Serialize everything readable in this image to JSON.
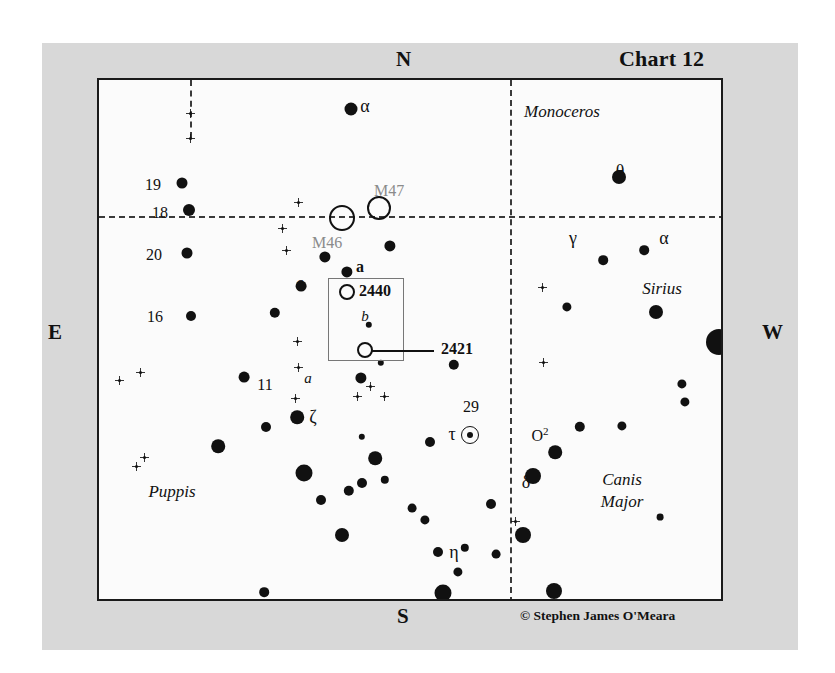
{
  "chart": {
    "title": "Chart 12",
    "credit": "© Stephen James O'Meara",
    "cardinals": {
      "n": "N",
      "s": "S",
      "e": "E",
      "w": "W"
    }
  },
  "constellations": [
    {
      "name": "Monoceros",
      "x": 560,
      "y": 110
    },
    {
      "name": "Puppis",
      "x": 170,
      "y": 490
    },
    {
      "name": "Canis",
      "x": 620,
      "y": 478
    },
    {
      "name": "Major",
      "x": 620,
      "y": 500
    }
  ],
  "deep_sky": [
    {
      "name": "M47",
      "x": 377,
      "y": 206,
      "r": 10,
      "label_dx": -5,
      "label_dy": -26,
      "style": "gray"
    },
    {
      "name": "M46",
      "x": 340,
      "y": 216,
      "r": 11,
      "label_dx": -30,
      "label_dy": 16,
      "style": "gray"
    },
    {
      "name": "2440",
      "x": 345,
      "y": 290,
      "r": 6,
      "label_dx": 12,
      "label_dy": -10,
      "style": "bold"
    },
    {
      "name": "2421",
      "x": 363,
      "y": 348,
      "r": 6,
      "label_dx": 76,
      "label_dy": -10,
      "style": "bold"
    }
  ],
  "labels": [
    {
      "text": "α",
      "x": 363,
      "y": 104,
      "type": "greek"
    },
    {
      "text": "θ",
      "x": 618,
      "y": 169,
      "type": "greek"
    },
    {
      "text": "γ",
      "x": 571,
      "y": 236,
      "type": "greek"
    },
    {
      "text": "α",
      "x": 662,
      "y": 236,
      "type": "greek"
    },
    {
      "text": "ζ",
      "x": 311,
      "y": 415,
      "type": "greek"
    },
    {
      "text": "τ",
      "x": 450,
      "y": 432,
      "type": "greek"
    },
    {
      "text": "δ",
      "x": 524,
      "y": 480,
      "type": "greek"
    },
    {
      "text": "η",
      "x": 452,
      "y": 550,
      "type": "greek"
    },
    {
      "text": "19",
      "x": 151,
      "y": 183,
      "type": "num"
    },
    {
      "text": "18",
      "x": 158,
      "y": 211,
      "type": "num"
    },
    {
      "text": "20",
      "x": 152,
      "y": 253,
      "type": "num"
    },
    {
      "text": "16",
      "x": 153,
      "y": 315,
      "type": "num"
    },
    {
      "text": "11",
      "x": 263,
      "y": 383,
      "type": "num"
    },
    {
      "text": "6",
      "x": 298,
      "y": 284,
      "type": "num"
    },
    {
      "text": "29",
      "x": 469,
      "y": 405,
      "type": "num"
    },
    {
      "text": "o",
      "x": 304,
      "y": 471,
      "type": "num"
    },
    {
      "text": "a",
      "x": 358,
      "y": 265,
      "type": "bold"
    },
    {
      "text": "b",
      "x": 363,
      "y": 314,
      "type": "italb"
    },
    {
      "text": "a",
      "x": 306,
      "y": 376,
      "type": "italb"
    },
    {
      "text": "Sirius",
      "x": 660,
      "y": 287,
      "type": "ital"
    }
  ],
  "sup_labels": [
    {
      "base": "O",
      "sup": "2",
      "x": 538,
      "y": 433
    }
  ],
  "chart_data": {
    "type": "scatter",
    "title": "Chart 12",
    "xlabel": "",
    "ylabel": "",
    "legend": "none",
    "grid": "dashed celestial grid",
    "axis_labels": {
      "top": "N",
      "bottom": "S",
      "left": "E",
      "right": "W"
    },
    "frame": {
      "x": 97,
      "y": 78,
      "w": 626,
      "h": 523
    },
    "gridlines": [
      {
        "orient": "h",
        "y": 136,
        "x0": 0,
        "x1": 626
      },
      {
        "orient": "v",
        "x": 411,
        "y0": 0,
        "y1": 523
      },
      {
        "orient": "v",
        "x": 91,
        "y0": 0,
        "y1": 58
      }
    ],
    "inset_box": {
      "x": 229,
      "y": 198,
      "w": 74,
      "h": 81
    },
    "stars": [
      {
        "x": 252,
        "y": 29,
        "r": 6.5
      },
      {
        "x": 91,
        "y": 33,
        "r": 3.2
      },
      {
        "x": 91,
        "y": 58,
        "r": 4.0
      },
      {
        "x": 83,
        "y": 103,
        "r": 5.5
      },
      {
        "x": 90,
        "y": 130,
        "r": 6.0
      },
      {
        "x": 88,
        "y": 173,
        "r": 5.5
      },
      {
        "x": 92,
        "y": 236,
        "r": 5.0
      },
      {
        "x": 199,
        "y": 122,
        "r": 3.4
      },
      {
        "x": 183,
        "y": 148,
        "r": 3.4
      },
      {
        "x": 187,
        "y": 170,
        "r": 3.4
      },
      {
        "x": 226,
        "y": 177,
        "r": 5.6
      },
      {
        "x": 248,
        "y": 192,
        "r": 5.6
      },
      {
        "x": 291,
        "y": 166,
        "r": 5.6
      },
      {
        "x": 202,
        "y": 206,
        "r": 5.4
      },
      {
        "x": 198,
        "y": 261,
        "r": 3.4
      },
      {
        "x": 199,
        "y": 287,
        "r": 3.4
      },
      {
        "x": 196,
        "y": 318,
        "r": 3.4
      },
      {
        "x": 176,
        "y": 233,
        "r": 5.2
      },
      {
        "x": 145,
        "y": 297,
        "r": 5.4
      },
      {
        "x": 20,
        "y": 300,
        "r": 3.3
      },
      {
        "x": 41,
        "y": 292,
        "r": 3.6
      },
      {
        "x": 45,
        "y": 377,
        "r": 3.3
      },
      {
        "x": 37,
        "y": 386,
        "r": 3.6
      },
      {
        "x": 198,
        "y": 337,
        "r": 6.8
      },
      {
        "x": 167,
        "y": 347,
        "r": 5.0
      },
      {
        "x": 119,
        "y": 366,
        "r": 6.8
      },
      {
        "x": 205,
        "y": 393,
        "r": 8.5
      },
      {
        "x": 222,
        "y": 420,
        "r": 5.0
      },
      {
        "x": 250,
        "y": 411,
        "r": 5.2
      },
      {
        "x": 243,
        "y": 455,
        "r": 7.0
      },
      {
        "x": 165,
        "y": 512,
        "r": 4.8
      },
      {
        "x": 262,
        "y": 298,
        "r": 5.6
      },
      {
        "x": 271,
        "y": 306,
        "r": 3.2
      },
      {
        "x": 285,
        "y": 316,
        "r": 3.2
      },
      {
        "x": 258,
        "y": 316,
        "r": 3.2
      },
      {
        "x": 282,
        "y": 283,
        "r": 3.2
      },
      {
        "x": 270,
        "y": 245,
        "r": 3.2
      },
      {
        "x": 263,
        "y": 357,
        "r": 3.2
      },
      {
        "x": 276,
        "y": 378,
        "r": 6.8
      },
      {
        "x": 263,
        "y": 403,
        "r": 5.0
      },
      {
        "x": 286,
        "y": 400,
        "r": 4.2
      },
      {
        "x": 443,
        "y": 207,
        "r": 3.6
      },
      {
        "x": 444,
        "y": 282,
        "r": 3.6
      },
      {
        "x": 355,
        "y": 285,
        "r": 5.2
      },
      {
        "x": 331,
        "y": 362,
        "r": 5.0
      },
      {
        "x": 392,
        "y": 424,
        "r": 5.0
      },
      {
        "x": 397,
        "y": 474,
        "r": 4.4
      },
      {
        "x": 359,
        "y": 492,
        "r": 4.6
      },
      {
        "x": 366,
        "y": 468,
        "r": 4.2
      },
      {
        "x": 434,
        "y": 396,
        "r": 8.0
      },
      {
        "x": 456,
        "y": 372,
        "r": 6.8
      },
      {
        "x": 424,
        "y": 455,
        "r": 8.0
      },
      {
        "x": 339,
        "y": 472,
        "r": 5.0
      },
      {
        "x": 326,
        "y": 440,
        "r": 4.6
      },
      {
        "x": 344,
        "y": 513,
        "r": 8.5
      },
      {
        "x": 455,
        "y": 511,
        "r": 8.0
      },
      {
        "x": 520,
        "y": 97,
        "r": 7.0
      },
      {
        "x": 504,
        "y": 180,
        "r": 4.8
      },
      {
        "x": 557,
        "y": 232,
        "r": 7.0
      },
      {
        "x": 468,
        "y": 227,
        "r": 4.6
      },
      {
        "x": 545,
        "y": 170,
        "r": 4.8
      },
      {
        "x": 620,
        "y": 262,
        "r": 13.0
      },
      {
        "x": 583,
        "y": 304,
        "r": 4.6
      },
      {
        "x": 586,
        "y": 322,
        "r": 4.6
      },
      {
        "x": 523,
        "y": 346,
        "r": 4.6
      },
      {
        "x": 481,
        "y": 347,
        "r": 5.2
      },
      {
        "x": 561,
        "y": 437,
        "r": 3.4
      },
      {
        "x": 313,
        "y": 428,
        "r": 4.4
      }
    ],
    "faint_stars": [
      {
        "x": 199,
        "y": 122
      },
      {
        "x": 183,
        "y": 148
      },
      {
        "x": 187,
        "y": 170
      },
      {
        "x": 198,
        "y": 261
      },
      {
        "x": 199,
        "y": 287
      },
      {
        "x": 196,
        "y": 318
      },
      {
        "x": 20,
        "y": 300
      },
      {
        "x": 41,
        "y": 292
      },
      {
        "x": 45,
        "y": 377
      },
      {
        "x": 37,
        "y": 386
      },
      {
        "x": 271,
        "y": 306
      },
      {
        "x": 285,
        "y": 316
      },
      {
        "x": 258,
        "y": 316
      },
      {
        "x": 443,
        "y": 207
      },
      {
        "x": 444,
        "y": 282
      },
      {
        "x": 91,
        "y": 33
      },
      {
        "x": 91,
        "y": 58
      },
      {
        "x": 416,
        "y": 441
      }
    ],
    "clusters": [
      {
        "name": "M46",
        "x": 340,
        "y": 216,
        "r": 11
      },
      {
        "name": "M47",
        "x": 377,
        "y": 206,
        "r": 10
      },
      {
        "name": "2440",
        "x": 345,
        "y": 290,
        "r": 6
      },
      {
        "name": "2421",
        "x": 363,
        "y": 348,
        "r": 6
      }
    ],
    "double_star": {
      "name": "tau",
      "x": 468,
      "y": 433,
      "r": 8
    },
    "named_objects": [
      "Sirius",
      "M46",
      "M47",
      "NGC 2440",
      "NGC 2421",
      "alpha CMa",
      "gamma CMa",
      "theta CMa",
      "delta CMa",
      "eta CMa",
      "omicron2 CMa",
      "tau CMa",
      "zeta Pup",
      "11 Pup",
      "16 Pup",
      "18 Pup",
      "19 Pup",
      "20 Pup",
      "6 Pup",
      "29 CMa",
      "a Pup",
      "b Pup",
      "o Pup"
    ]
  }
}
